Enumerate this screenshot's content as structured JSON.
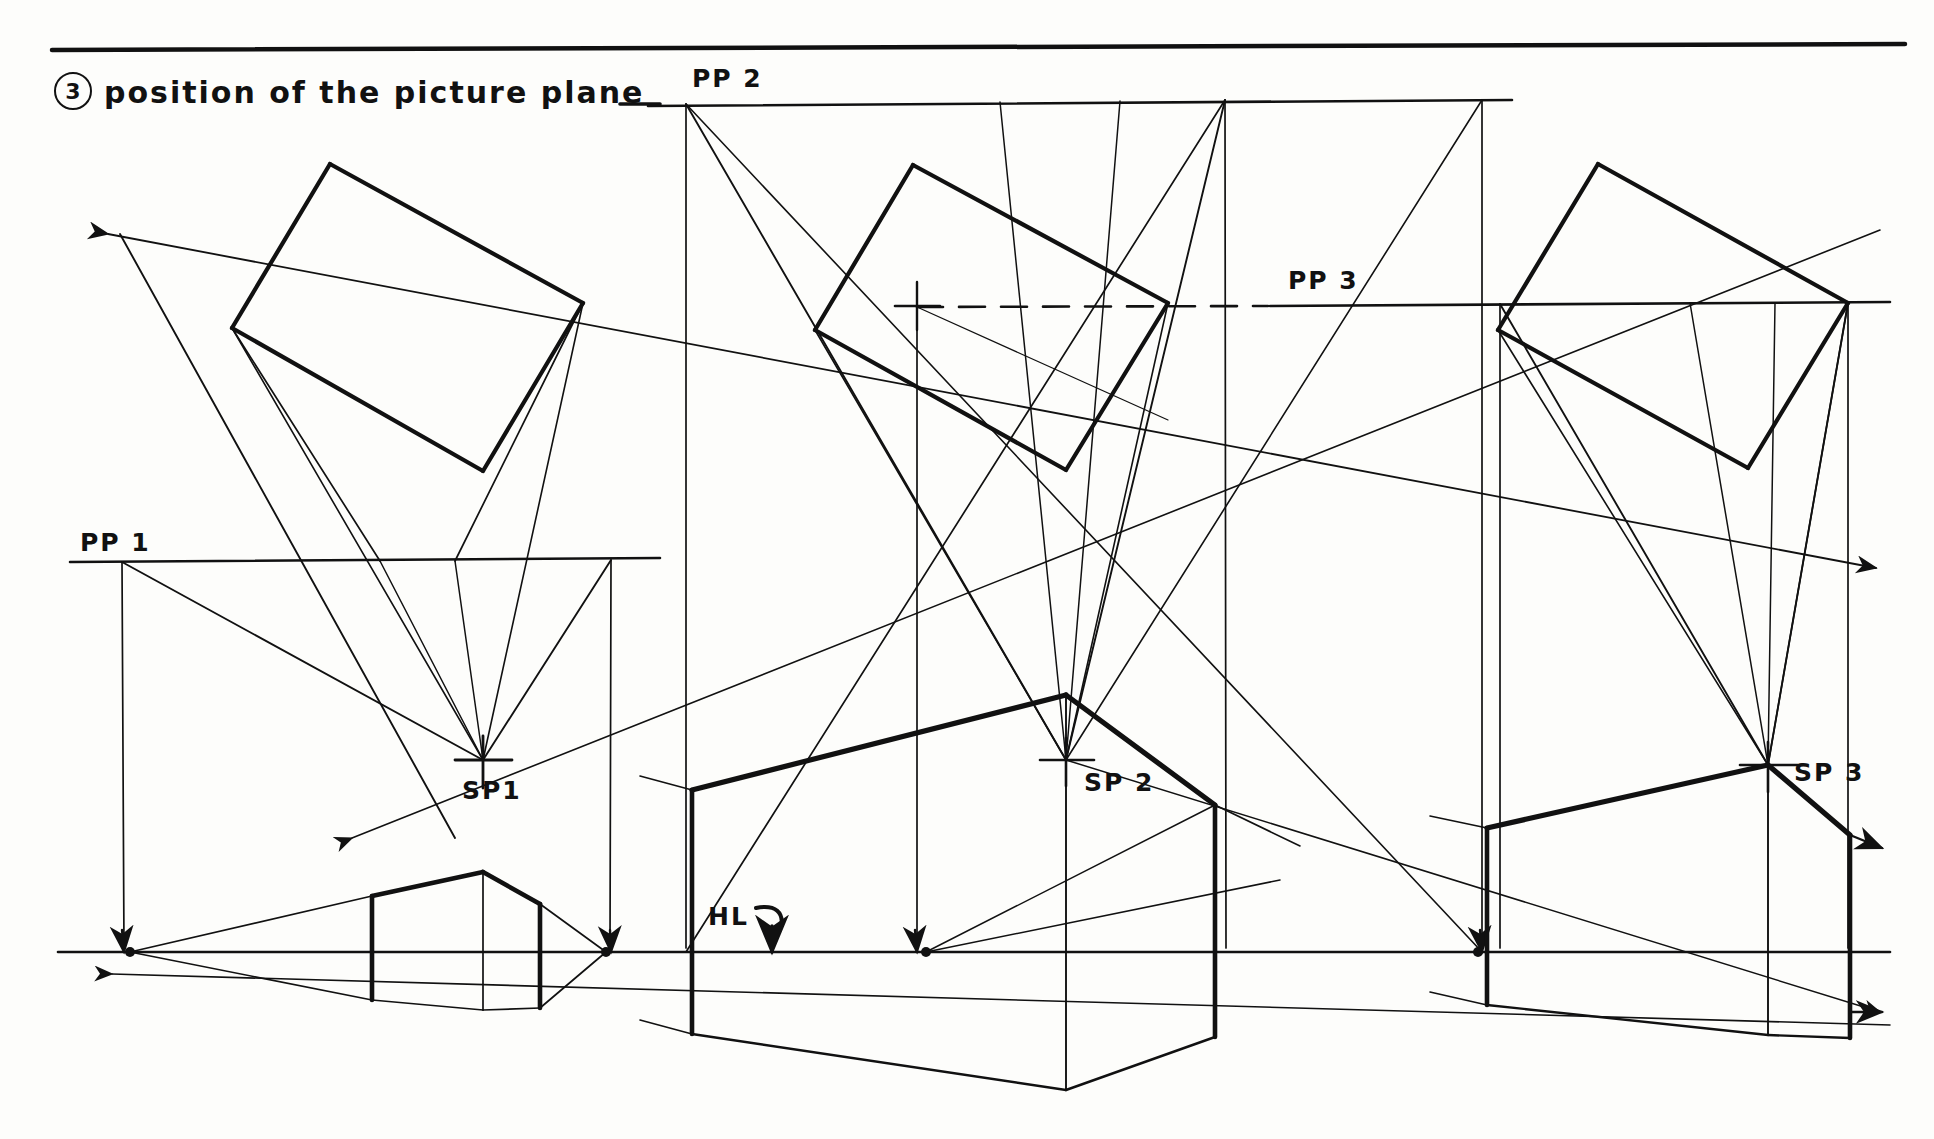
{
  "sheet": {
    "background_color": "#fdfdfb",
    "ink_color": "#111111",
    "width": 1934,
    "height": 1139
  },
  "title": {
    "number": "3",
    "text": "position of the picture plane"
  },
  "labels": {
    "pp1": "PP 1",
    "pp2": "PP 2",
    "pp3": "PP 3",
    "sp1": "SP1",
    "sp2": "SP 2",
    "sp3": "SP 3",
    "hl": "HL"
  },
  "drawing": {
    "description": "Hand-drawn architectural perspective construction showing three picture-plane positions",
    "top_rule": {
      "y": 48,
      "x1": 52,
      "x2": 1905
    },
    "horizon_line": {
      "y": 952,
      "x1": 58,
      "x2": 1890,
      "label": "HL"
    },
    "picture_planes": [
      {
        "name": "PP 1",
        "y": 561,
        "x1": 70,
        "x2": 660,
        "label_x": 78,
        "label_y": 534
      },
      {
        "name": "PP 2",
        "y": 105,
        "x1": 648,
        "x2": 1512,
        "label_x": 692,
        "label_y": 72
      },
      {
        "name": "PP 3",
        "y": 305,
        "x1": 917,
        "x2": 1890,
        "label_x": 1282,
        "label_y": 272,
        "dash_from": 917,
        "dash_to": 1270
      }
    ],
    "station_points": [
      {
        "name": "SP1",
        "x": 483,
        "y": 760,
        "label_x": 463,
        "label_y": 780
      },
      {
        "name": "SP 2",
        "x": 1066,
        "y": 760,
        "label_x": 1083,
        "label_y": 770
      },
      {
        "name": "SP 3",
        "x": 1768,
        "y": 765,
        "label_x": 1790,
        "label_y": 760
      }
    ],
    "plans": [
      {
        "id": "plan-1",
        "top": [
          330,
          164
        ],
        "left": [
          232,
          328
        ],
        "right": [
          583,
          303
        ],
        "bottom": [
          483,
          471
        ]
      },
      {
        "id": "plan-2",
        "top": [
          913,
          165
        ],
        "left": [
          815,
          330
        ],
        "right": [
          1168,
          303
        ],
        "bottom": [
          1066,
          470
        ]
      },
      {
        "id": "plan-3",
        "top": [
          1598,
          164
        ],
        "left": [
          1498,
          330
        ],
        "right": [
          1848,
          303
        ],
        "bottom": [
          1748,
          468
        ]
      }
    ],
    "perspective_houses": [
      {
        "id": "house-1",
        "left_x": 372,
        "right_x": 540,
        "peak": [
          483,
          872
        ],
        "vp_left": [
          130,
          952
        ],
        "vp_right": [
          606,
          952
        ]
      },
      {
        "id": "house-2",
        "left_x": 692,
        "right_x": 1215,
        "peak": [
          1066,
          695
        ],
        "vp_left": [
          926,
          952
        ],
        "vp_right": [
          1478,
          952
        ]
      },
      {
        "id": "house-3",
        "left_x": 1487,
        "right_x": 1850,
        "peak": [
          1768,
          765
        ],
        "vp_left": [
          1478,
          952
        ],
        "vp_right": [
          1905,
          952
        ]
      }
    ],
    "arrows": [
      {
        "id": "arrow-upper-left",
        "to": [
          108,
          232
        ],
        "direction": "up-left"
      },
      {
        "id": "arrow-mid-left",
        "to": [
          438,
          838
        ],
        "direction": "left"
      },
      {
        "id": "arrow-lower-left",
        "to": [
          110,
          974
        ],
        "direction": "left"
      },
      {
        "id": "arrow-upper-right",
        "to": [
          1876,
          568
        ],
        "direction": "up-right"
      },
      {
        "id": "arrow-mid-right",
        "to": [
          1880,
          845
        ],
        "direction": "down-right"
      },
      {
        "id": "arrow-lower-right",
        "to": [
          1880,
          1012
        ],
        "direction": "right"
      }
    ]
  }
}
